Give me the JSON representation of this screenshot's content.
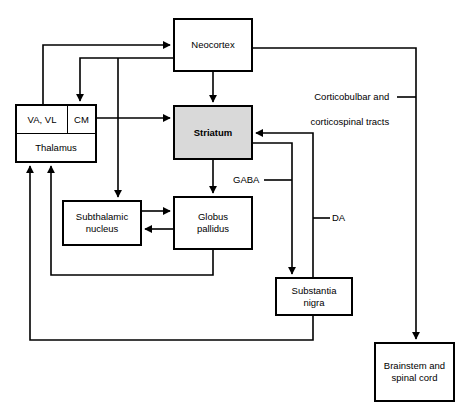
{
  "diagram": {
    "nodes": {
      "neocortex": {
        "label": "Neocortex"
      },
      "thalamus": {
        "va_vl": "VA,  VL",
        "cm": "CM",
        "label": "Thalamus"
      },
      "striatum": {
        "label": "Striatum",
        "fill": "#d9d9d9",
        "emphasis": "bold"
      },
      "subthalamic": {
        "label": "Subthalamic\nnucleus",
        "line1": "Subthalamic",
        "line2": "nucleus"
      },
      "globus": {
        "label": "Globus\npallidus",
        "line1": "Globus",
        "line2": "pallidus"
      },
      "substantia": {
        "label": "Substantia\nnigra",
        "line1": "Substantia",
        "line2": "nigra"
      },
      "brainstem": {
        "label": "Brainstem and\nspinal cord",
        "line1": "Brainstem and",
        "line2": "spinal cord"
      }
    },
    "edge_labels": {
      "tracts_line1": "Corticobulbar and",
      "tracts_line2": "corticospinal tracts",
      "gaba": "GABA",
      "da": "DA"
    },
    "colors": {
      "stroke": "#000000",
      "background": "#ffffff",
      "shaded_fill": "#d9d9d9"
    }
  }
}
